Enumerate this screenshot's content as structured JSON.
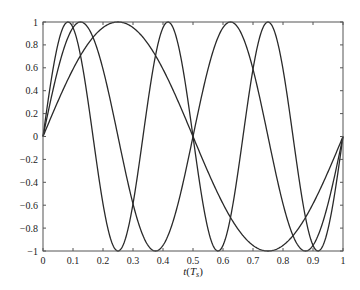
{
  "chart_data": {
    "type": "line",
    "title": "",
    "xlabel": "t(T_s)",
    "xlabel_main": "t",
    "xlabel_paren_open": "(",
    "xlabel_var": "T",
    "xlabel_sub": "s",
    "xlabel_paren_close": ")",
    "ylabel": "",
    "xlim": [
      0,
      1
    ],
    "ylim": [
      -1,
      1
    ],
    "grid": false,
    "legend": null,
    "x_ticks": [
      "0",
      "0.1",
      "0.2",
      "0.3",
      "0.4",
      "0.5",
      "0.6",
      "0.7",
      "0.8",
      "0.9",
      "1"
    ],
    "y_ticks": [
      "1",
      "0.8",
      "0.6",
      "0.4",
      "0.2",
      "0",
      "−0.2",
      "−0.4",
      "−0.6",
      "−0.8",
      "−1"
    ],
    "series": [
      {
        "name": "sin(2πt)",
        "cycles": 1,
        "x": [
          0,
          0.125,
          0.25,
          0.375,
          0.5,
          0.625,
          0.75,
          0.875,
          1
        ],
        "values": [
          0,
          0.707,
          1,
          0.707,
          0,
          -0.707,
          -1,
          -0.707,
          0
        ]
      },
      {
        "name": "sin(4πt)",
        "cycles": 2,
        "x": [
          0,
          0.125,
          0.25,
          0.375,
          0.5,
          0.625,
          0.75,
          0.875,
          1
        ],
        "values": [
          0,
          1,
          0,
          -1,
          0,
          1,
          0,
          -1,
          0
        ]
      },
      {
        "name": "sin(6πt)",
        "cycles": 3,
        "x": [
          0,
          0.0833,
          0.1667,
          0.25,
          0.3333,
          0.4167,
          0.5,
          0.5833,
          0.6667,
          0.75,
          0.8333,
          0.9167,
          1
        ],
        "values": [
          0,
          1,
          0,
          -1,
          0,
          1,
          0,
          -1,
          0,
          1,
          0,
          -1,
          0
        ]
      }
    ],
    "line_color": "#2a2a2a",
    "axis_color": "#555555"
  }
}
